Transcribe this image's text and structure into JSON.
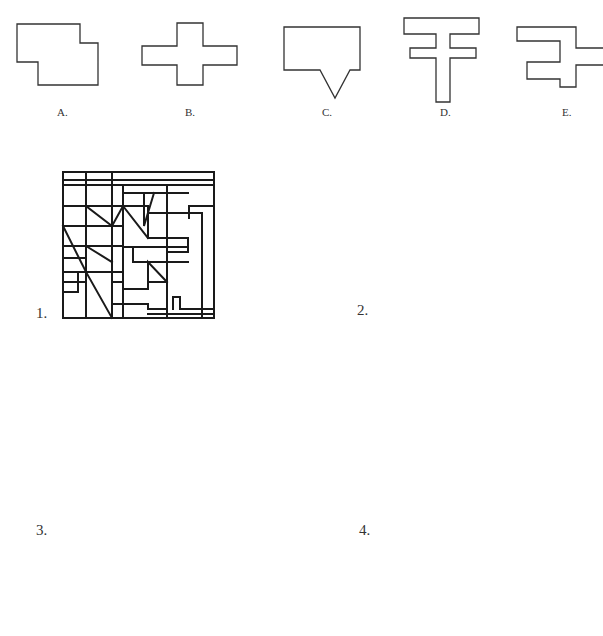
{
  "page": {
    "top_text_fragment": "",
    "options": [
      {
        "id": "A",
        "label": "A."
      },
      {
        "id": "B",
        "label": "B."
      },
      {
        "id": "C",
        "label": "C."
      },
      {
        "id": "D",
        "label": "D."
      },
      {
        "id": "E",
        "label": "E."
      }
    ],
    "figures": [
      {
        "id": 1,
        "label": "1."
      },
      {
        "id": 2,
        "label": "2."
      },
      {
        "id": 3,
        "label": "3."
      },
      {
        "id": 4,
        "label": "4."
      },
      {
        "id": 5,
        "label": ""
      }
    ]
  }
}
